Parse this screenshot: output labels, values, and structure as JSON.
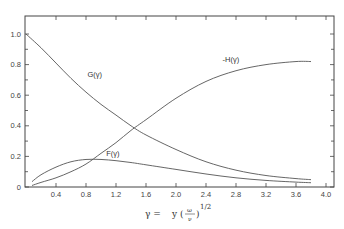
{
  "chart_data": {
    "type": "line",
    "title": "",
    "xlabel": "γ = y (ω/ν)^1/2",
    "ylabel": "",
    "xlim": [
      0,
      4.0
    ],
    "ylim": [
      0,
      1.0
    ],
    "grid": false,
    "legend": "inline curve labels",
    "x_ticks": [
      "0.4",
      "0.8",
      "1.2",
      "1.6",
      "2.0",
      "2.4",
      "2.8",
      "3.2",
      "3.6",
      "4.0"
    ],
    "y_ticks": [
      "0",
      "0.2",
      "0.4",
      "0.6",
      "0.8",
      "1.0"
    ],
    "x_tick_values": [
      0.4,
      0.8,
      1.2,
      1.6,
      2.0,
      2.4,
      2.8,
      3.2,
      3.6,
      4.0
    ],
    "y_tick_values": [
      0,
      0.2,
      0.4,
      0.6,
      0.8,
      1.0
    ],
    "series": [
      {
        "name": "G(γ)",
        "label_pos": [
          0.82,
          0.72
        ],
        "x": [
          0.0,
          0.2,
          0.4,
          0.6,
          0.8,
          1.0,
          1.2,
          1.4,
          1.6,
          2.0,
          2.4,
          2.8,
          3.2,
          3.6,
          3.8
        ],
        "values": [
          1.0,
          0.91,
          0.81,
          0.71,
          0.62,
          0.54,
          0.47,
          0.4,
          0.34,
          0.245,
          0.165,
          0.11,
          0.075,
          0.055,
          0.048
        ]
      },
      {
        "name": "-H(γ)",
        "label_pos": [
          2.62,
          0.82
        ],
        "x": [
          0.08,
          0.2,
          0.4,
          0.6,
          0.8,
          1.0,
          1.2,
          1.4,
          1.6,
          2.0,
          2.4,
          2.8,
          3.2,
          3.6,
          3.8
        ],
        "values": [
          0.01,
          0.03,
          0.06,
          0.1,
          0.15,
          0.22,
          0.29,
          0.37,
          0.44,
          0.58,
          0.69,
          0.76,
          0.8,
          0.82,
          0.82
        ]
      },
      {
        "name": "F(γ)",
        "label_pos": [
          1.07,
          0.2
        ],
        "x": [
          0.08,
          0.2,
          0.4,
          0.6,
          0.8,
          1.0,
          1.2,
          1.4,
          1.6,
          2.0,
          2.4,
          2.8,
          3.2,
          3.6,
          3.8
        ],
        "values": [
          0.035,
          0.08,
          0.13,
          0.165,
          0.18,
          0.18,
          0.172,
          0.16,
          0.145,
          0.115,
          0.085,
          0.06,
          0.043,
          0.032,
          0.028
        ]
      }
    ]
  },
  "labels": {
    "xlabel_gamma": "γ =",
    "xlabel_y": "y (",
    "xlabel_num": "ω",
    "xlabel_den": "ν",
    "xlabel_close": ")",
    "xlabel_exp": "1/2"
  }
}
